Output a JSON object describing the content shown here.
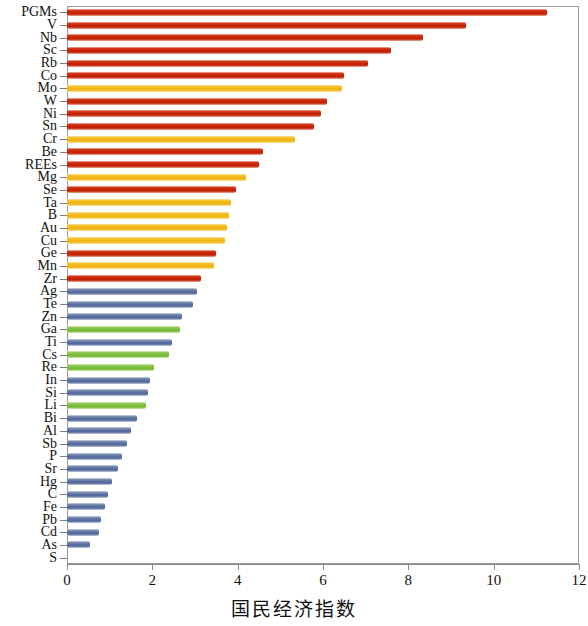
{
  "chart_data": {
    "type": "bar",
    "orientation": "horizontal",
    "title": "",
    "subtitle": "",
    "xlabel": "国民经济指数",
    "ylabel": "",
    "xlim": [
      0,
      12
    ],
    "ylim": null,
    "xticks": [
      0,
      2,
      4,
      6,
      8,
      10,
      12
    ],
    "xticklabels": [
      "0",
      "2",
      "4",
      "6",
      "8",
      "10",
      "12"
    ],
    "grid": false,
    "legend": null,
    "legend_position": "none",
    "categories": [
      "PGMs",
      "V",
      "Nb",
      "Sc",
      "Rb",
      "Co",
      "Mo",
      "W",
      "Ni",
      "Sn",
      "Cr",
      "Be",
      "REEs",
      "Mg",
      "Se",
      "Ta",
      "B",
      "Au",
      "Cu",
      "Ge",
      "Mn",
      "Zr",
      "Ag",
      "Te",
      "Zn",
      "Ga",
      "Ti",
      "Cs",
      "Re",
      "In",
      "Si",
      "Li",
      "Bi",
      "Al",
      "Sb",
      "P",
      "Sr",
      "Hg",
      "C",
      "Fe",
      "Pb",
      "Cd",
      "As",
      "S"
    ],
    "values": [
      11.25,
      9.35,
      8.35,
      7.6,
      7.05,
      6.5,
      6.45,
      6.1,
      5.95,
      5.8,
      5.35,
      4.6,
      4.5,
      4.2,
      3.95,
      3.85,
      3.8,
      3.75,
      3.7,
      3.5,
      3.45,
      3.15,
      3.05,
      2.95,
      2.7,
      2.65,
      2.45,
      2.4,
      2.05,
      1.95,
      1.9,
      1.85,
      1.65,
      1.5,
      1.4,
      1.3,
      1.2,
      1.05,
      0.95,
      0.9,
      0.8,
      0.75,
      0.55,
      0.0
    ],
    "bar_colors": [
      "red",
      "red",
      "red",
      "red",
      "red",
      "red",
      "yellow",
      "red",
      "red",
      "red",
      "yellow",
      "red",
      "red",
      "yellow",
      "red",
      "yellow",
      "yellow",
      "yellow",
      "yellow",
      "red",
      "yellow",
      "red",
      "blue",
      "blue",
      "blue",
      "green",
      "blue",
      "green",
      "green",
      "blue",
      "blue",
      "green",
      "blue",
      "blue",
      "blue",
      "blue",
      "blue",
      "blue",
      "blue",
      "blue",
      "blue",
      "blue",
      "blue",
      "blue"
    ],
    "color_map": {
      "red": "#c62608",
      "yellow": "#f0b91a",
      "blue": "#5d71a0",
      "green": "#7cbe3f"
    }
  }
}
